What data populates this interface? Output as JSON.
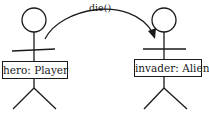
{
  "diagram": {
    "message": "die()",
    "actors": [
      {
        "id": "hero",
        "label": "hero: Player"
      },
      {
        "id": "invader",
        "label": "invader: Alien"
      }
    ]
  }
}
